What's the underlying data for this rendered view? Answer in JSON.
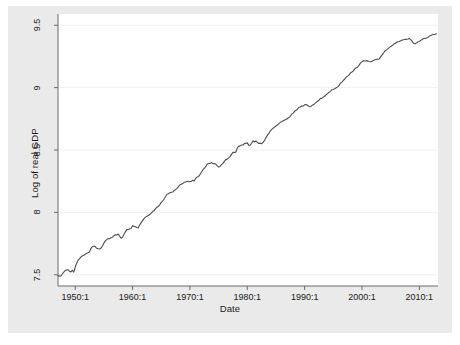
{
  "figure": {
    "background_color": "#eaeaea",
    "plot_background_color": "#ffffff",
    "line_color": "#4d4d4d",
    "axis_color": "#6b6b6b",
    "grid_color": "#f0f0f0",
    "text_color": "#1a1a1a"
  },
  "chart_data": {
    "type": "line",
    "title": "",
    "xlabel": "Date",
    "ylabel": "Log of real GDP",
    "xlim": [
      1947.0,
      2013.25
    ],
    "ylim": [
      7.41,
      9.59
    ],
    "grid": true,
    "legend": "none",
    "xticklabels": [
      "1950:1",
      "1960:1",
      "1970:1",
      "1980:1",
      "1990:1",
      "2000:1",
      "2010:1"
    ],
    "xtickvalues": [
      1950,
      1960,
      1970,
      1980,
      1990,
      2000,
      2010
    ],
    "yticklabels": [
      "7.5",
      "8",
      "8.5",
      "9",
      "9.5"
    ],
    "ytickvalues": [
      7.5,
      8,
      8.5,
      9,
      9.5
    ],
    "series": [
      {
        "name": "Log of real GDP",
        "x": [
          1947.0,
          1947.25,
          1947.5,
          1947.75,
          1948.0,
          1948.25,
          1948.5,
          1948.75,
          1949.0,
          1949.25,
          1949.5,
          1949.75,
          1950.0,
          1950.25,
          1950.5,
          1950.75,
          1951.0,
          1951.25,
          1951.5,
          1951.75,
          1952.0,
          1952.25,
          1952.5,
          1952.75,
          1953.0,
          1953.25,
          1953.5,
          1953.75,
          1954.0,
          1954.25,
          1954.5,
          1954.75,
          1955.0,
          1955.25,
          1955.5,
          1955.75,
          1956.0,
          1956.25,
          1956.5,
          1956.75,
          1957.0,
          1957.25,
          1957.5,
          1957.75,
          1958.0,
          1958.25,
          1958.5,
          1958.75,
          1959.0,
          1959.25,
          1959.5,
          1959.75,
          1960.0,
          1960.25,
          1960.5,
          1960.75,
          1961.0,
          1961.25,
          1961.5,
          1961.75,
          1962.0,
          1962.25,
          1962.5,
          1962.75,
          1963.0,
          1963.25,
          1963.5,
          1963.75,
          1964.0,
          1964.25,
          1964.5,
          1964.75,
          1965.0,
          1965.25,
          1965.5,
          1965.75,
          1966.0,
          1966.25,
          1966.5,
          1966.75,
          1967.0,
          1967.25,
          1967.5,
          1967.75,
          1968.0,
          1968.25,
          1968.5,
          1968.75,
          1969.0,
          1969.25,
          1969.5,
          1969.75,
          1970.0,
          1970.25,
          1970.5,
          1970.75,
          1971.0,
          1971.25,
          1971.5,
          1971.75,
          1972.0,
          1972.25,
          1972.5,
          1972.75,
          1973.0,
          1973.25,
          1973.5,
          1973.75,
          1974.0,
          1974.25,
          1974.5,
          1974.75,
          1975.0,
          1975.25,
          1975.5,
          1975.75,
          1976.0,
          1976.25,
          1976.5,
          1976.75,
          1977.0,
          1977.25,
          1977.5,
          1977.75,
          1978.0,
          1978.25,
          1978.5,
          1978.75,
          1979.0,
          1979.25,
          1979.5,
          1979.75,
          1980.0,
          1980.25,
          1980.5,
          1980.75,
          1981.0,
          1981.25,
          1981.5,
          1981.75,
          1982.0,
          1982.25,
          1982.5,
          1982.75,
          1983.0,
          1983.25,
          1983.5,
          1983.75,
          1984.0,
          1984.25,
          1984.5,
          1984.75,
          1985.0,
          1985.25,
          1985.5,
          1985.75,
          1986.0,
          1986.25,
          1986.5,
          1986.75,
          1987.0,
          1987.25,
          1987.5,
          1987.75,
          1988.0,
          1988.25,
          1988.5,
          1988.75,
          1989.0,
          1989.25,
          1989.5,
          1989.75,
          1990.0,
          1990.25,
          1990.5,
          1990.75,
          1991.0,
          1991.25,
          1991.5,
          1991.75,
          1992.0,
          1992.25,
          1992.5,
          1992.75,
          1993.0,
          1993.25,
          1993.5,
          1993.75,
          1994.0,
          1994.25,
          1994.5,
          1994.75,
          1995.0,
          1995.25,
          1995.5,
          1995.75,
          1996.0,
          1996.25,
          1996.5,
          1996.75,
          1997.0,
          1997.25,
          1997.5,
          1997.75,
          1998.0,
          1998.25,
          1998.5,
          1998.75,
          1999.0,
          1999.25,
          1999.5,
          1999.75,
          2000.0,
          2000.25,
          2000.5,
          2000.75,
          2001.0,
          2001.25,
          2001.5,
          2001.75,
          2002.0,
          2002.25,
          2002.5,
          2002.75,
          2003.0,
          2003.25,
          2003.5,
          2003.75,
          2004.0,
          2004.25,
          2004.5,
          2004.75,
          2005.0,
          2005.25,
          2005.5,
          2005.75,
          2006.0,
          2006.25,
          2006.5,
          2006.75,
          2007.0,
          2007.25,
          2007.5,
          2007.75,
          2008.0,
          2008.25,
          2008.5,
          2008.75,
          2009.0,
          2009.25,
          2009.5,
          2009.75,
          2010.0,
          2010.25,
          2010.5,
          2010.75,
          2011.0,
          2011.25,
          2011.5,
          2011.75,
          2012.0,
          2012.25,
          2012.5,
          2012.75,
          2013.0
        ],
        "y": [
          7.493,
          7.489,
          7.49,
          7.506,
          7.521,
          7.534,
          7.539,
          7.54,
          7.529,
          7.523,
          7.536,
          7.521,
          7.562,
          7.592,
          7.617,
          7.63,
          7.642,
          7.651,
          7.657,
          7.664,
          7.672,
          7.677,
          7.684,
          7.712,
          7.725,
          7.731,
          7.726,
          7.712,
          7.708,
          7.707,
          7.714,
          7.731,
          7.754,
          7.772,
          7.782,
          7.79,
          7.79,
          7.797,
          7.801,
          7.813,
          7.82,
          7.819,
          7.827,
          7.81,
          7.793,
          7.801,
          7.822,
          7.844,
          7.862,
          7.862,
          7.869,
          7.871,
          7.892,
          7.889,
          7.885,
          7.879,
          7.876,
          7.9,
          7.918,
          7.934,
          7.95,
          7.962,
          7.969,
          7.975,
          7.983,
          7.995,
          8.007,
          8.013,
          8.03,
          8.041,
          8.049,
          8.062,
          8.08,
          8.09,
          8.107,
          8.127,
          8.145,
          8.149,
          8.158,
          8.161,
          8.163,
          8.175,
          8.182,
          8.192,
          8.206,
          8.22,
          8.225,
          8.231,
          8.241,
          8.244,
          8.25,
          8.246,
          8.245,
          8.25,
          8.257,
          8.252,
          8.273,
          8.283,
          8.288,
          8.303,
          8.322,
          8.34,
          8.353,
          8.366,
          8.386,
          8.392,
          8.393,
          8.4,
          8.391,
          8.392,
          8.386,
          8.374,
          8.363,
          8.368,
          8.383,
          8.393,
          8.409,
          8.423,
          8.427,
          8.437,
          8.447,
          8.465,
          8.481,
          8.481,
          8.483,
          8.516,
          8.529,
          8.533,
          8.54,
          8.54,
          8.551,
          8.554,
          8.557,
          8.539,
          8.538,
          8.554,
          8.574,
          8.564,
          8.572,
          8.561,
          8.552,
          8.555,
          8.55,
          8.561,
          8.576,
          8.599,
          8.617,
          8.633,
          8.652,
          8.665,
          8.674,
          8.683,
          8.692,
          8.7,
          8.712,
          8.722,
          8.727,
          8.734,
          8.74,
          8.744,
          8.752,
          8.76,
          8.77,
          8.787,
          8.796,
          8.81,
          8.818,
          8.827,
          8.841,
          8.845,
          8.852,
          8.853,
          8.862,
          8.864,
          8.859,
          8.849,
          8.847,
          8.856,
          8.862,
          8.871,
          8.881,
          8.891,
          8.899,
          8.914,
          8.913,
          8.924,
          8.93,
          8.943,
          8.952,
          8.963,
          8.97,
          8.983,
          8.985,
          8.99,
          8.999,
          9.006,
          9.017,
          9.036,
          9.044,
          9.058,
          9.069,
          9.084,
          9.092,
          9.102,
          9.118,
          9.125,
          9.134,
          9.15,
          9.16,
          9.166,
          9.18,
          9.198,
          9.208,
          9.215,
          9.213,
          9.216,
          9.214,
          9.21,
          9.207,
          9.212,
          9.217,
          9.223,
          9.226,
          9.227,
          9.23,
          9.246,
          9.262,
          9.277,
          9.294,
          9.302,
          9.311,
          9.32,
          9.33,
          9.337,
          9.347,
          9.354,
          9.361,
          9.368,
          9.369,
          9.375,
          9.381,
          9.383,
          9.388,
          9.387,
          9.39,
          9.394,
          9.385,
          9.371,
          9.355,
          9.352,
          9.357,
          9.367,
          9.37,
          9.379,
          9.386,
          9.395,
          9.394,
          9.398,
          9.402,
          9.413,
          9.418,
          9.423,
          9.426,
          9.427,
          9.431
        ]
      }
    ]
  }
}
